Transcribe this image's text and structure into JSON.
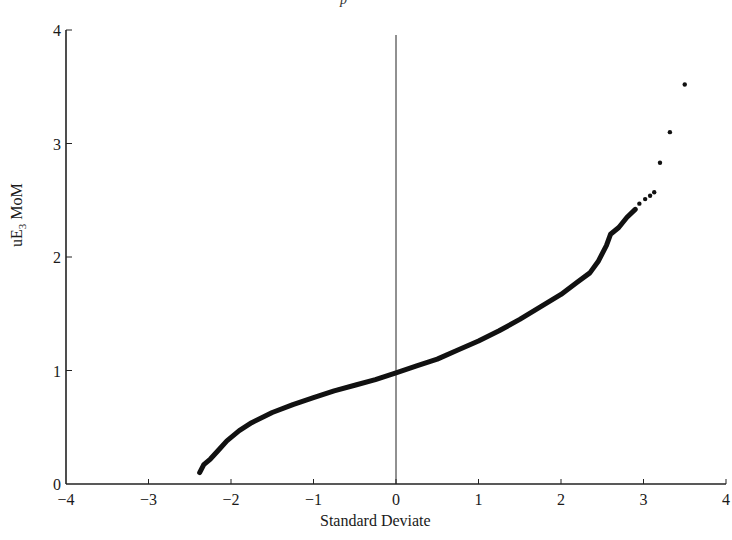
{
  "chart_data": {
    "type": "scatter",
    "title_fragment": "p",
    "xlabel": "Standard Deviate",
    "ylabel_main": "uE",
    "ylabel_sub": "3",
    "ylabel_tail": " MoM",
    "xlim": [
      -4,
      4
    ],
    "ylim": [
      0,
      4
    ],
    "xticks": [
      -4,
      -3,
      -2,
      -1,
      0,
      1,
      2,
      3,
      4
    ],
    "xtick_labels": [
      "−4",
      "−3",
      "−2",
      "−1",
      "0",
      "1",
      "2",
      "3",
      "4"
    ],
    "yticks": [
      0,
      1,
      2,
      3,
      4
    ],
    "ytick_labels": [
      "0",
      "1",
      "2",
      "3",
      "4"
    ],
    "grid": false,
    "reference_line_x": 0,
    "curve": [
      [
        -2.38,
        0.1
      ],
      [
        -2.33,
        0.17
      ],
      [
        -2.25,
        0.22
      ],
      [
        -2.15,
        0.3
      ],
      [
        -2.05,
        0.38
      ],
      [
        -1.9,
        0.47
      ],
      [
        -1.75,
        0.54
      ],
      [
        -1.5,
        0.63
      ],
      [
        -1.25,
        0.7
      ],
      [
        -1.0,
        0.76
      ],
      [
        -0.75,
        0.82
      ],
      [
        -0.5,
        0.87
      ],
      [
        -0.25,
        0.92
      ],
      [
        0.0,
        0.98
      ],
      [
        0.25,
        1.04
      ],
      [
        0.5,
        1.1
      ],
      [
        0.75,
        1.18
      ],
      [
        1.0,
        1.26
      ],
      [
        1.25,
        1.35
      ],
      [
        1.5,
        1.45
      ],
      [
        1.75,
        1.56
      ],
      [
        2.0,
        1.67
      ],
      [
        2.2,
        1.78
      ],
      [
        2.35,
        1.86
      ],
      [
        2.45,
        1.96
      ],
      [
        2.55,
        2.1
      ],
      [
        2.6,
        2.2
      ],
      [
        2.7,
        2.26
      ],
      [
        2.8,
        2.35
      ],
      [
        2.9,
        2.42
      ]
    ],
    "outliers": [
      [
        2.95,
        2.47
      ],
      [
        3.02,
        2.51
      ],
      [
        3.08,
        2.54
      ],
      [
        3.13,
        2.57
      ],
      [
        3.2,
        2.83
      ],
      [
        3.32,
        3.1
      ],
      [
        3.5,
        3.52
      ]
    ]
  }
}
